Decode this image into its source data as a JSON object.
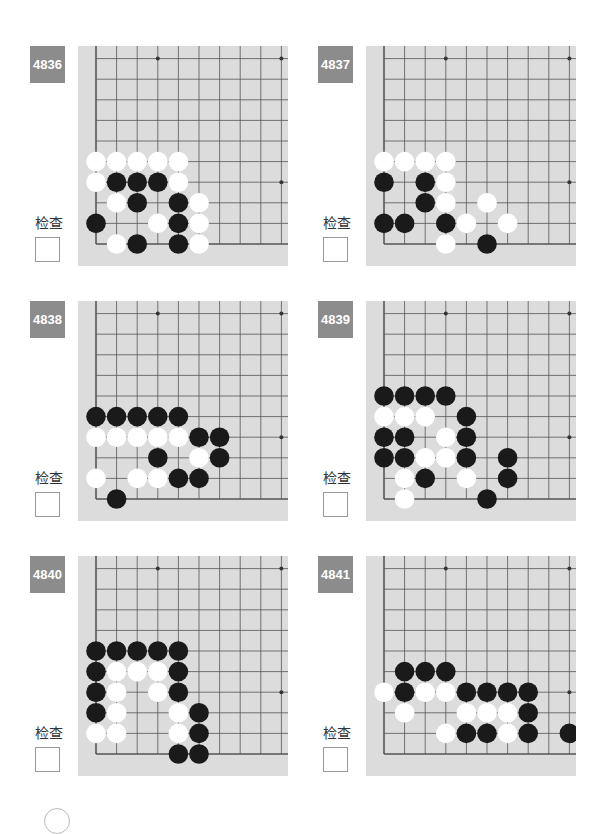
{
  "check_label": "检查",
  "board": {
    "cols": 10,
    "rows": 11,
    "spacing": 20.6,
    "origin_x": 18,
    "origin_y": 198,
    "star_points": [
      [
        3,
        9
      ],
      [
        9,
        9
      ],
      [
        9,
        3
      ]
    ],
    "colors": {
      "board": "#dcdcdc",
      "line": "#555555",
      "black": "#1a1a1a",
      "white": "#ffffff",
      "label_bg": "#8c8c8c"
    }
  },
  "problems": [
    {
      "number": "4836",
      "black": [
        [
          1,
          3
        ],
        [
          2,
          3
        ],
        [
          3,
          3
        ],
        [
          2,
          2
        ],
        [
          4,
          2
        ],
        [
          0,
          1
        ],
        [
          4,
          1
        ],
        [
          2,
          0
        ],
        [
          4,
          0
        ]
      ],
      "white": [
        [
          0,
          4
        ],
        [
          1,
          4
        ],
        [
          2,
          4
        ],
        [
          3,
          4
        ],
        [
          4,
          4
        ],
        [
          0,
          3
        ],
        [
          4,
          3
        ],
        [
          1,
          2
        ],
        [
          5,
          2
        ],
        [
          3,
          1
        ],
        [
          5,
          1
        ],
        [
          1,
          0
        ],
        [
          5,
          0
        ]
      ]
    },
    {
      "number": "4837",
      "black": [
        [
          0,
          3
        ],
        [
          2,
          3
        ],
        [
          2,
          2
        ],
        [
          0,
          1
        ],
        [
          1,
          1
        ],
        [
          3,
          1
        ],
        [
          5,
          0
        ]
      ],
      "white": [
        [
          0,
          4
        ],
        [
          1,
          4
        ],
        [
          2,
          4
        ],
        [
          3,
          4
        ],
        [
          3,
          3
        ],
        [
          3,
          2
        ],
        [
          5,
          2
        ],
        [
          4,
          1
        ],
        [
          6,
          1
        ],
        [
          3,
          0
        ]
      ]
    },
    {
      "number": "4838",
      "black": [
        [
          0,
          4
        ],
        [
          1,
          4
        ],
        [
          2,
          4
        ],
        [
          3,
          4
        ],
        [
          4,
          4
        ],
        [
          5,
          3
        ],
        [
          6,
          3
        ],
        [
          3,
          2
        ],
        [
          6,
          2
        ],
        [
          4,
          1
        ],
        [
          5,
          1
        ],
        [
          1,
          0
        ]
      ],
      "white": [
        [
          0,
          3
        ],
        [
          1,
          3
        ],
        [
          2,
          3
        ],
        [
          3,
          3
        ],
        [
          4,
          3
        ],
        [
          5,
          2
        ],
        [
          0,
          1
        ],
        [
          2,
          1
        ],
        [
          3,
          1
        ]
      ]
    },
    {
      "number": "4839",
      "black": [
        [
          0,
          5
        ],
        [
          1,
          5
        ],
        [
          2,
          5
        ],
        [
          3,
          5
        ],
        [
          4,
          4
        ],
        [
          0,
          3
        ],
        [
          1,
          3
        ],
        [
          4,
          3
        ],
        [
          0,
          2
        ],
        [
          1,
          2
        ],
        [
          4,
          2
        ],
        [
          6,
          2
        ],
        [
          2,
          1
        ],
        [
          6,
          1
        ],
        [
          5,
          0
        ]
      ],
      "white": [
        [
          0,
          4
        ],
        [
          1,
          4
        ],
        [
          2,
          4
        ],
        [
          3,
          3
        ],
        [
          2,
          2
        ],
        [
          3,
          2
        ],
        [
          1,
          1
        ],
        [
          4,
          1
        ],
        [
          1,
          0
        ]
      ]
    },
    {
      "number": "4840",
      "black": [
        [
          0,
          5
        ],
        [
          1,
          5
        ],
        [
          2,
          5
        ],
        [
          3,
          5
        ],
        [
          4,
          5
        ],
        [
          0,
          4
        ],
        [
          4,
          4
        ],
        [
          0,
          3
        ],
        [
          4,
          3
        ],
        [
          0,
          2
        ],
        [
          5,
          2
        ],
        [
          5,
          1
        ],
        [
          4,
          0
        ],
        [
          5,
          0
        ]
      ],
      "white": [
        [
          1,
          4
        ],
        [
          2,
          4
        ],
        [
          3,
          4
        ],
        [
          1,
          3
        ],
        [
          3,
          3
        ],
        [
          1,
          2
        ],
        [
          4,
          2
        ],
        [
          0,
          1
        ],
        [
          1,
          1
        ],
        [
          4,
          1
        ]
      ]
    },
    {
      "number": "4841",
      "black": [
        [
          1,
          4
        ],
        [
          2,
          4
        ],
        [
          3,
          4
        ],
        [
          1,
          3
        ],
        [
          4,
          3
        ],
        [
          5,
          3
        ],
        [
          6,
          3
        ],
        [
          7,
          3
        ],
        [
          7,
          2
        ],
        [
          4,
          1
        ],
        [
          5,
          1
        ],
        [
          7,
          1
        ],
        [
          9,
          1
        ]
      ],
      "white": [
        [
          0,
          3
        ],
        [
          2,
          3
        ],
        [
          3,
          3
        ],
        [
          1,
          2
        ],
        [
          4,
          2
        ],
        [
          5,
          2
        ],
        [
          6,
          2
        ],
        [
          3,
          1
        ],
        [
          6,
          1
        ]
      ]
    }
  ]
}
